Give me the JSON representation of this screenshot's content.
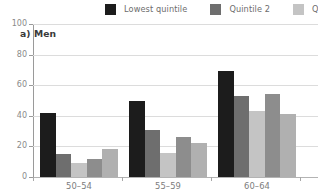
{
  "panel": {
    "title": "a) Men"
  },
  "legend": {
    "position": "top",
    "items": [
      {
        "label": "Lowest  quintile",
        "color": "#1c1c1c",
        "swatch_name": "legend-swatch-lowest-quintile"
      },
      {
        "label": "Quintile 2",
        "color": "#6e6e6e",
        "swatch_name": "legend-swatch-quintile-2"
      },
      {
        "label": "Qui",
        "color": "#c4c4c4",
        "swatch_name": "legend-swatch-quintile-3"
      }
    ]
  },
  "chart_data": {
    "type": "bar",
    "title": "a) Men",
    "subtitle": "",
    "xlabel": "",
    "ylabel": "",
    "categories": [
      "50–54",
      "55–59",
      "60–64"
    ],
    "series": [
      {
        "name": "Lowest  quintile",
        "color": "#1c1c1c",
        "values": [
          42,
          50,
          69
        ]
      },
      {
        "name": "Quintile 2",
        "color": "#6e6e6e",
        "values": [
          15,
          31,
          53
        ]
      },
      {
        "name": "Quintile 3",
        "color": "#c4c4c4",
        "values": [
          9,
          16,
          43
        ]
      },
      {
        "name": "Quintile 4",
        "color": "#8d8d8d",
        "values": [
          12,
          26,
          54
        ]
      },
      {
        "name": "Highest quintile",
        "color": "#b0b0b0",
        "values": [
          18,
          22,
          41
        ]
      }
    ],
    "ylim": [
      0,
      100
    ],
    "yticks": [
      0,
      20,
      40,
      60,
      80,
      100
    ],
    "ytick_labels": [
      "0",
      "20",
      "40",
      "60",
      "80",
      "100"
    ],
    "grid": true,
    "grid_axis": "y",
    "legend_position": "top"
  },
  "colors": {
    "gridline": "#dcdcdc",
    "axis": "#9a9a9a",
    "tick_label": "#8a8a8a",
    "background": "#ffffff"
  }
}
